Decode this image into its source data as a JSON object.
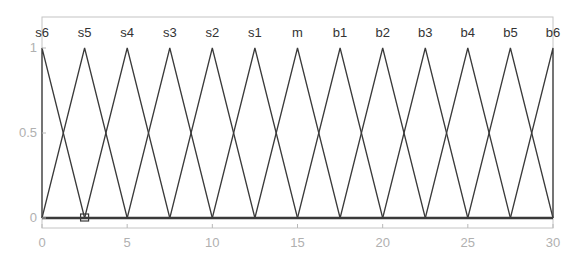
{
  "chart_data": {
    "type": "line",
    "title": "",
    "xlabel": "",
    "ylabel": "",
    "xlim": [
      0,
      30
    ],
    "ylim": [
      0,
      1
    ],
    "grid": false,
    "legend_position": "none",
    "x_ticks": [
      0,
      5,
      10,
      15,
      20,
      25,
      30
    ],
    "y_ticks": [
      0,
      0.5,
      1
    ],
    "x_tick_labels": [
      "0",
      "5",
      "10",
      "15",
      "20",
      "25",
      "30"
    ],
    "y_tick_labels": [
      "0",
      "0.5",
      "1"
    ],
    "membership_labels": [
      "s6",
      "s5",
      "s4",
      "s3",
      "s2",
      "s1",
      "m",
      "b1",
      "b2",
      "b3",
      "b4",
      "b5",
      "b6"
    ],
    "series": [
      {
        "name": "s6",
        "x": [
          0,
          0,
          2.5
        ],
        "y": [
          0,
          1,
          0
        ]
      },
      {
        "name": "s5",
        "x": [
          0,
          2.5,
          5
        ],
        "y": [
          0,
          1,
          0
        ]
      },
      {
        "name": "s4",
        "x": [
          2.5,
          5,
          7.5
        ],
        "y": [
          0,
          1,
          0
        ]
      },
      {
        "name": "s3",
        "x": [
          5,
          7.5,
          10
        ],
        "y": [
          0,
          1,
          0
        ]
      },
      {
        "name": "s2",
        "x": [
          7.5,
          10,
          12.5
        ],
        "y": [
          0,
          1,
          0
        ]
      },
      {
        "name": "s1",
        "x": [
          10,
          12.5,
          15
        ],
        "y": [
          0,
          1,
          0
        ]
      },
      {
        "name": "m",
        "x": [
          12.5,
          15,
          17.5
        ],
        "y": [
          0,
          1,
          0
        ]
      },
      {
        "name": "b1",
        "x": [
          15,
          17.5,
          20
        ],
        "y": [
          0,
          1,
          0
        ]
      },
      {
        "name": "b2",
        "x": [
          17.5,
          20,
          22.5
        ],
        "y": [
          0,
          1,
          0
        ]
      },
      {
        "name": "b3",
        "x": [
          20,
          22.5,
          25
        ],
        "y": [
          0,
          1,
          0
        ]
      },
      {
        "name": "b4",
        "x": [
          22.5,
          25,
          27.5
        ],
        "y": [
          0,
          1,
          0
        ]
      },
      {
        "name": "b5",
        "x": [
          25,
          27.5,
          30
        ],
        "y": [
          0,
          1,
          0
        ]
      },
      {
        "name": "b6",
        "x": [
          27.5,
          30,
          30
        ],
        "y": [
          0,
          1,
          0
        ]
      }
    ],
    "annotations": [
      {
        "type": "square-marker",
        "x": 2.5,
        "y": 0
      }
    ],
    "colors": {
      "line": "#3a3a3a",
      "axis": "#b8b8b8",
      "tick_text": "#b0b0b0",
      "label_text": "#333333",
      "baseline": "#3a3a3a"
    }
  }
}
